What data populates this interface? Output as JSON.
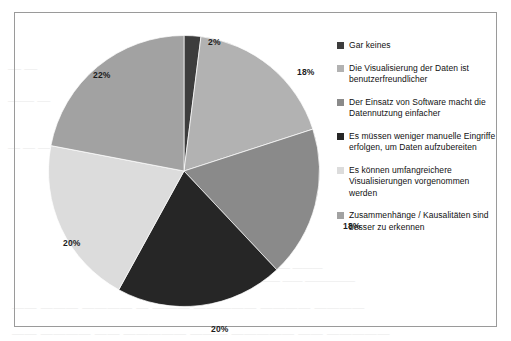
{
  "scan_artifacts": {
    "lines": [
      "— —— — ———  ——— ————  — ———— ——",
      "— —",
      "—— —",
      "— — —",
      "———— ———",
      "——— —— —————",
      "——  ——— ————  — ——— ————— ———— ————",
      "—— ———— —— ————— ——— —————  —— —————"
    ]
  },
  "chart_data": {
    "type": "pie",
    "title": "",
    "subtitle": "",
    "xlabel": "",
    "ylabel": "",
    "legend_position": "right",
    "grid": false,
    "value_unit": "%",
    "start_angle_deg": 0,
    "direction": "clockwise",
    "categories": [
      "Gar keines",
      "Die Visualisierung der Daten ist benutzerfreundlicher",
      "Der Einsatz von Software macht die Datennutzung einfacher",
      "Es müssen weniger manuelle Eingriffe erfolgen, um Daten aufzubereiten",
      "Es können umfangreichere Visualisierungen vorgenommen werden",
      "Zusammenhänge / Kausalitäten sind besser zu erkennen"
    ],
    "values": [
      2,
      18,
      18,
      20,
      20,
      22
    ],
    "data_labels": [
      "2%",
      "18%",
      "18%",
      "20%",
      "20%",
      "22%"
    ],
    "colors": [
      "#3d3d3d",
      "#b2b2b2",
      "#8a8a8a",
      "#262626",
      "#dcdcdc",
      "#a2a2a2"
    ],
    "slices": [
      {
        "label": "Gar keines",
        "value": 2,
        "data_label": "2%",
        "color": "#3d3d3d",
        "label_pos": {
          "left": 160,
          "top": 2
        }
      },
      {
        "label": "Die Visualisierung der Daten ist benutzerfreundlicher",
        "value": 18,
        "data_label": "18%",
        "color": "#b2b2b2",
        "label_pos": {
          "left": 249,
          "top": 32
        }
      },
      {
        "label": "Der Einsatz von Software macht die Datennutzung einfacher",
        "value": 18,
        "data_label": "18%",
        "color": "#8a8a8a",
        "label_pos": {
          "left": 295,
          "top": 186
        }
      },
      {
        "label": "Es müssen weniger manuelle Eingriffe erfolgen, um Daten aufzubereiten",
        "value": 20,
        "data_label": "20%",
        "color": "#262626",
        "label_pos": {
          "left": 163,
          "top": 289
        }
      },
      {
        "label": "Es können umfangreichere Visualisierungen vorgenommen werden",
        "value": 20,
        "data_label": "20%",
        "color": "#dcdcdc",
        "label_pos": {
          "left": 15,
          "top": 203
        }
      },
      {
        "label": "Zusammenhänge / Kausalitäten sind besser zu erkennen",
        "value": 22,
        "data_label": "22%",
        "color": "#a2a2a2",
        "label_pos": {
          "left": 45,
          "top": 35
        }
      }
    ]
  },
  "legend": {
    "items": [
      {
        "label": "Gar keines",
        "color": "#3d3d3d"
      },
      {
        "label": "Die Visualisierung der Daten ist benutzerfreundlicher",
        "color": "#b2b2b2"
      },
      {
        "label": "Der Einsatz von Software macht die Datennutzung einfacher",
        "color": "#8a8a8a"
      },
      {
        "label": "Es müssen weniger manuelle Eingriffe erfolgen, um Daten aufzubereiten",
        "color": "#262626"
      },
      {
        "label": "Es können umfangreichere Visualisierungen vorgenommen werden",
        "color": "#dcdcdc"
      },
      {
        "label": "Zusammenhänge / Kausalitäten sind besser zu erkennen",
        "color": "#a2a2a2"
      }
    ]
  },
  "frame": {
    "border_color": "#9a9a9a",
    "background": "#ffffff"
  }
}
